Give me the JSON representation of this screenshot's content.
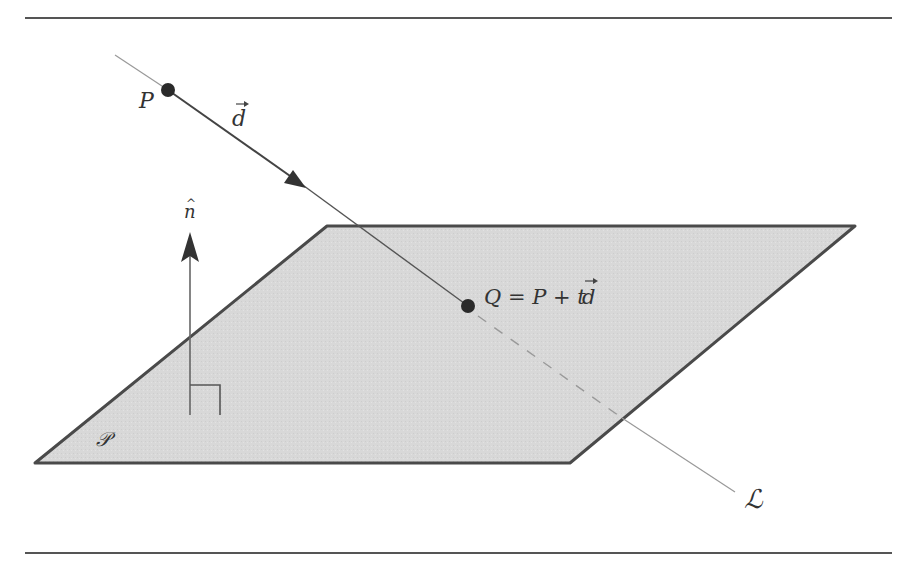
{
  "figure": {
    "labels": {
      "point_p": "P",
      "direction": "d",
      "normal": "n",
      "normal_hat": "^",
      "intersection": "Q = P + t",
      "intersection_vec": "d",
      "line": "ℒ",
      "plane": "𝒫"
    },
    "colors": {
      "plane_fill": "#d6d6d6",
      "plane_edge": "#4a4a4a",
      "line": "#8a8a8a",
      "vector": "#444444",
      "point": "#2a2a2a",
      "rule": "#555555"
    }
  }
}
